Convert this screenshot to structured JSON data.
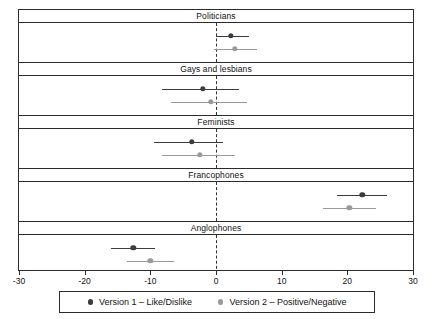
{
  "chart_data": {
    "type": "scatter",
    "title": "",
    "xlabel": "",
    "ylabel": "",
    "xlim": [
      -30,
      30
    ],
    "grid": false,
    "zero_reference_line": 0,
    "legend_position": "bottom",
    "xticks": [
      -30,
      -20,
      -10,
      0,
      10,
      20,
      30
    ],
    "xticklabels": [
      "-30",
      "-20",
      "-10",
      "0",
      "10",
      "20",
      "30"
    ],
    "panels": [
      "Politicians",
      "Gays and lesbians",
      "Feminists",
      "Francophones",
      "Anglophones"
    ],
    "series": [
      {
        "name": "Version 1 - Like/Dislike",
        "color": "#3c3c3c",
        "values": [
          2.3,
          -2.0,
          -3.7,
          22.3,
          -12.6
        ],
        "ci_low": [
          0.0,
          -8.2,
          -9.5,
          18.5,
          -16.0
        ],
        "ci_high": [
          5.0,
          3.5,
          1.0,
          26.0,
          -9.3
        ]
      },
      {
        "name": "Version 2 - Positive/Negative",
        "color": "#9a9a9a",
        "values": [
          2.9,
          -0.8,
          -2.5,
          20.3,
          -10.0
        ],
        "ci_low": [
          -0.3,
          -6.8,
          -8.2,
          16.3,
          -13.6
        ],
        "ci_high": [
          6.2,
          4.7,
          2.9,
          24.3,
          -6.4
        ]
      }
    ]
  },
  "legend": {
    "items": [
      {
        "label": "Version 1 – Like/Dislike",
        "marker": "filled-circle-dark"
      },
      {
        "label": "Version 2 – Positive/Negative",
        "marker": "filled-circle-light"
      }
    ]
  }
}
